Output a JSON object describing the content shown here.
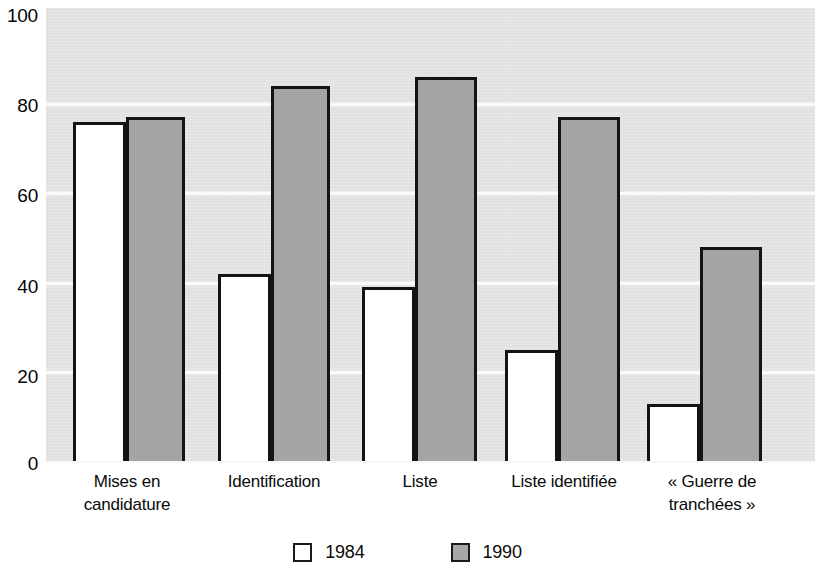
{
  "chart_data": {
    "type": "bar",
    "title": "",
    "subtitle": "",
    "xlabel": "",
    "ylabel": "",
    "categories": [
      "Mises en\ncandidature",
      "Identification",
      "Liste",
      "Liste identifiée",
      "« Guerre de\ntranchées »"
    ],
    "series": [
      {
        "name": "1984",
        "values": [
          76,
          42,
          39,
          25,
          13
        ],
        "color": "#ffffff"
      },
      {
        "name": "1990",
        "values": [
          77,
          84,
          86,
          77,
          48
        ],
        "color": "#a8a8a8"
      }
    ],
    "ylim": [
      0,
      100
    ],
    "ytick_labels": [
      "100",
      "80",
      "60",
      "40",
      "20",
      "0"
    ],
    "ytick_values": [
      100,
      80,
      60,
      40,
      20,
      0
    ],
    "grid": true,
    "grid_orientation": "horizontal",
    "legend_position": "bottom",
    "plot_background": "#e6e6e6",
    "bar_outline_color": "#141414",
    "gridline_color": "#fafafa"
  },
  "legend": {
    "entries": [
      {
        "label": "1984",
        "swatch": "legend-swatch-white"
      },
      {
        "label": "1990",
        "swatch": "legend-swatch-grey"
      }
    ]
  }
}
